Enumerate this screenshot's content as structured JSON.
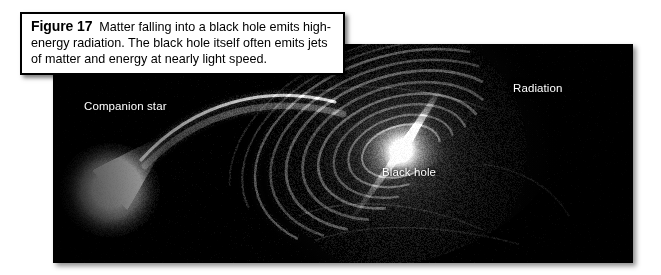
{
  "figure": {
    "caption": {
      "label": "Figure 17",
      "body": "Matter falling into a black hole emits high-energy radiation. The black hole itself often emits jets of matter and energy at nearly light speed."
    },
    "image": {
      "alt_description": "Black-and-white astronomical illustration of a binary system: a bright companion star at left streaming matter into a spiral accretion disk around a black hole at center-right, with a narrow jet of radiation emerging from the core.",
      "background_color": "#000000",
      "labels": [
        {
          "name": "companion-star",
          "text": "Companion star"
        },
        {
          "name": "black-hole",
          "text": "Black hole"
        },
        {
          "name": "radiation",
          "text": "Radiation"
        }
      ]
    }
  }
}
